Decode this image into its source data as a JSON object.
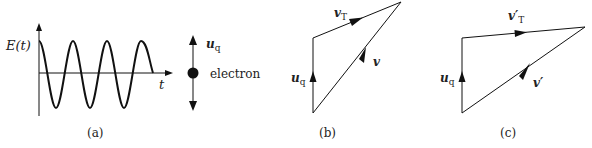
{
  "figure": {
    "panels": [
      {
        "id": "a",
        "caption": "(a)",
        "y_axis_label": "E(t)",
        "x_axis_label": "t",
        "vector_label": "u",
        "vector_subscript": "q",
        "particle_label": "electron",
        "wave": {
          "amplitude_px": 33,
          "period_px": 34,
          "cycles": 3.35
        }
      },
      {
        "id": "b",
        "caption": "(b)",
        "vectors": [
          {
            "name": "u_q",
            "label": "u",
            "subscript": "q"
          },
          {
            "name": "v_T",
            "label": "v",
            "subscript": "T"
          },
          {
            "name": "v",
            "label": "v",
            "subscript": ""
          }
        ]
      },
      {
        "id": "c",
        "caption": "(c)",
        "vectors": [
          {
            "name": "u_q",
            "label": "u",
            "subscript": "q"
          },
          {
            "name": "v'_T",
            "label": "v′",
            "subscript": "T"
          },
          {
            "name": "v'",
            "label": "v′",
            "subscript": ""
          }
        ]
      }
    ],
    "colors": {
      "stroke": "#111111",
      "text": "#222222",
      "background": "#ffffff"
    }
  }
}
